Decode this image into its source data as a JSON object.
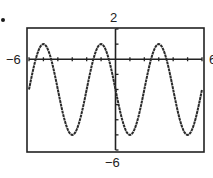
{
  "problem_marker": "•",
  "window": {
    "xmin_label": "−6",
    "xmax_label": "6",
    "ymax_label": "2",
    "ymin_label": "−6"
  },
  "chart_data": {
    "type": "line",
    "title": "",
    "xlabel": "",
    "ylabel": "",
    "xlim": [
      -6,
      6
    ],
    "ylim": [
      -6,
      2
    ],
    "x_ticks_every": 1,
    "y_ticks_every": 1,
    "grid": false,
    "legend": null,
    "series": [
      {
        "name": "f(x) ≈ 3cos(π/2·(x+1)) − 2",
        "amplitude": 3,
        "midline": -2,
        "period": 4,
        "x": [
          -6,
          -5.5,
          -5,
          -4.5,
          -4,
          -3.5,
          -3,
          -2.5,
          -2,
          -1.5,
          -1,
          -0.5,
          0,
          0.5,
          1,
          1.5,
          2,
          2.5,
          3,
          3.5,
          4,
          4.5,
          5,
          5.5,
          6
        ],
        "y": [
          -2,
          -0.12,
          1,
          -0.12,
          -2,
          -4.12,
          -5,
          -4.12,
          -2,
          -0.12,
          1,
          -0.12,
          -2,
          -4.12,
          -5,
          -4.12,
          -2,
          -0.12,
          1,
          -0.12,
          -2,
          -4.12,
          -5,
          -4.12,
          -2
        ]
      }
    ],
    "maxima_x": [
      -5,
      -1,
      3
    ],
    "minima_x": [
      -3,
      1,
      5
    ]
  }
}
